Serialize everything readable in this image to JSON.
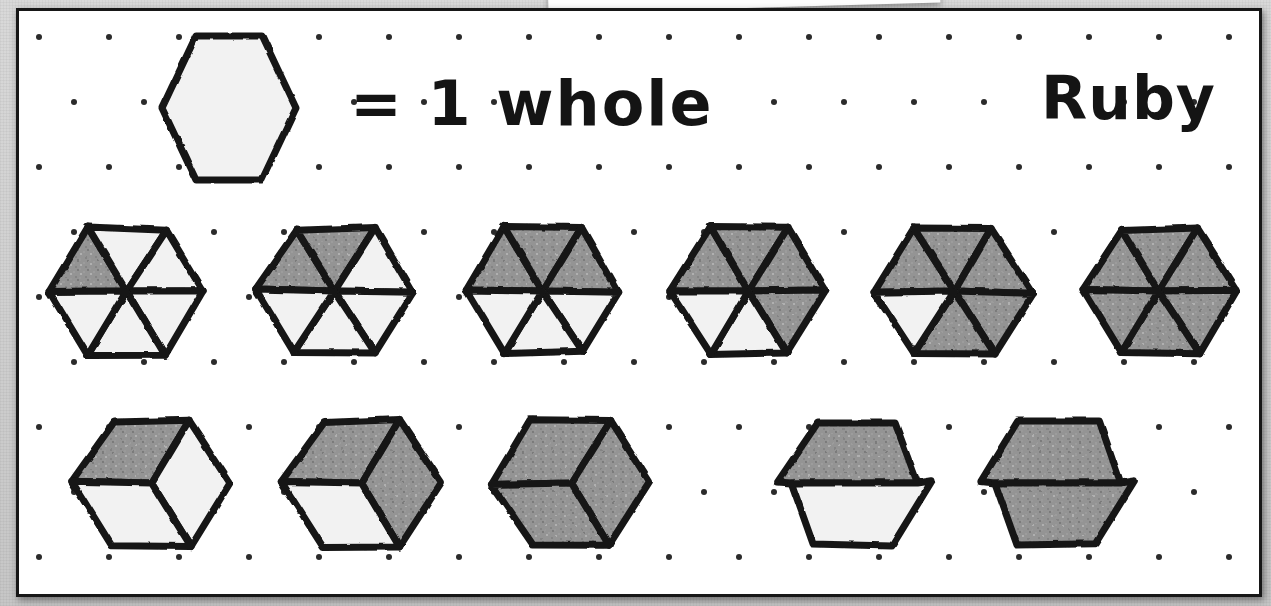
{
  "page": {
    "student_name": "Ruby",
    "key_label": "= 1 whole",
    "paper_color": "#ffffff",
    "ink_color": "#171717",
    "shade_color": "#8f8f8f",
    "dot_color": "#2b2b2b"
  },
  "legend": {
    "shape_name": "whole-hexagon",
    "shaded_parts": 0,
    "total_parts": 1,
    "caption": "= 1 whole"
  },
  "rows": [
    {
      "name": "sixths-row",
      "partition": "sixths",
      "total_parts": 6,
      "items": [
        {
          "label": "1/6",
          "shaded_parts": 1,
          "shaded_indices": [
            0
          ]
        },
        {
          "label": "2/6",
          "shaded_parts": 2,
          "shaded_indices": [
            0,
            1
          ]
        },
        {
          "label": "3/6",
          "shaded_parts": 3,
          "shaded_indices": [
            0,
            1,
            2
          ]
        },
        {
          "label": "4/6",
          "shaded_parts": 4,
          "shaded_indices": [
            0,
            1,
            2,
            3
          ]
        },
        {
          "label": "5/6",
          "shaded_parts": 5,
          "shaded_indices": [
            0,
            1,
            2,
            3,
            4
          ]
        },
        {
          "label": "6/6",
          "shaded_parts": 6,
          "shaded_indices": [
            0,
            1,
            2,
            3,
            4,
            5
          ]
        }
      ]
    },
    {
      "name": "thirds-and-halves-row",
      "partition": "mixed",
      "items": [
        {
          "label": "1/3",
          "partition": "thirds",
          "total_parts": 3,
          "shaded_parts": 1,
          "shaded_indices": [
            0
          ]
        },
        {
          "label": "2/3",
          "partition": "thirds",
          "total_parts": 3,
          "shaded_parts": 2,
          "shaded_indices": [
            0,
            1
          ]
        },
        {
          "label": "3/3",
          "partition": "thirds",
          "total_parts": 3,
          "shaded_parts": 3,
          "shaded_indices": [
            0,
            1,
            2
          ]
        },
        {
          "label": "1/2",
          "partition": "halves",
          "total_parts": 2,
          "shaded_parts": 1,
          "shaded_indices": [
            0
          ]
        },
        {
          "label": "2/2",
          "partition": "halves",
          "total_parts": 2,
          "shaded_parts": 2,
          "shaded_indices": [
            0,
            1
          ]
        }
      ]
    }
  ],
  "grid": {
    "type": "isometric-dot-grid",
    "column_spacing": 70,
    "row_spacing": 65
  }
}
